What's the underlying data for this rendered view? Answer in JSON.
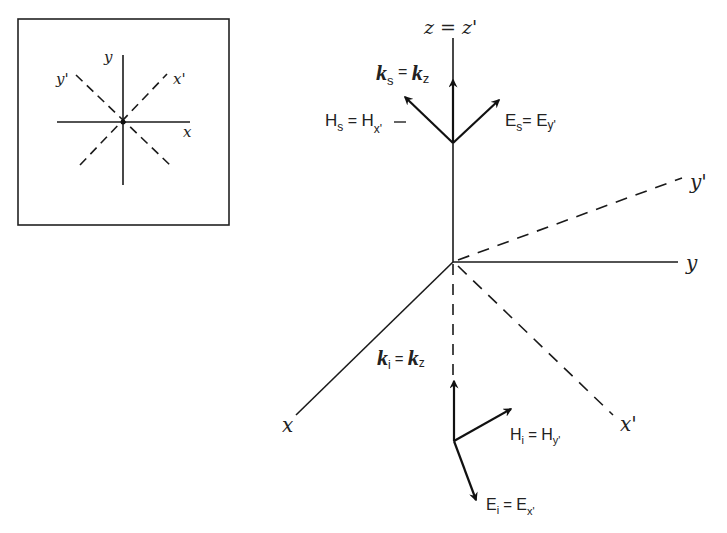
{
  "inset": {
    "labels": {
      "x": "x",
      "y": "y",
      "x_prime": "x'",
      "y_prime": "y'"
    }
  },
  "axes": {
    "z_label": "z = z'",
    "x": "x",
    "y": "y",
    "x_prime": "x'",
    "y_prime": "y'"
  },
  "scattered": {
    "k": {
      "main": "k",
      "sub": "s",
      "eq": " = ",
      "rhs": "k",
      "rhs_sub": "z"
    },
    "H": {
      "main": "H",
      "sub": "s",
      "eq": " = ",
      "rhs": "H",
      "rhs_sub": "x'",
      "rhs_sub_overline": true
    },
    "E": {
      "main": "E",
      "sub": "s",
      "eq": "= ",
      "rhs": "E",
      "rhs_sub": "y'"
    }
  },
  "incident": {
    "k": {
      "main": "k",
      "sub": "i",
      "eq": " = ",
      "rhs": "k",
      "rhs_sub": "z"
    },
    "H": {
      "main": "H",
      "sub": "i",
      "eq": " = ",
      "rhs": "H",
      "rhs_sub": "y'"
    },
    "E": {
      "main": "E",
      "sub": "i",
      "eq": " = ",
      "rhs": "E",
      "rhs_sub": "x'"
    }
  },
  "colors": {
    "line": "#1a1a1a",
    "text": "#222222",
    "background": "#ffffff"
  }
}
